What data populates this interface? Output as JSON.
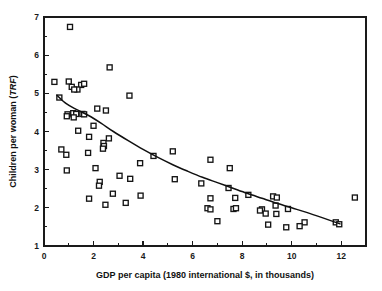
{
  "chart_data": {
    "type": "scatter",
    "title": "",
    "xlabel": "GDP per capita (1980 international $, in thousands)",
    "ylabel": "Children per woman (TRF)",
    "ylabel_plain": "Children per woman (",
    "ylabel_italic": "TRF",
    "ylabel_tail": ")",
    "xlim": [
      0,
      13
    ],
    "ylim": [
      1,
      7
    ],
    "grid": false,
    "legend": "none",
    "x_ticks": [
      0,
      2,
      4,
      6,
      8,
      10,
      12
    ],
    "x_tick_labels": [
      "0",
      "2",
      "4",
      "6",
      "8",
      "10",
      "12"
    ],
    "x_minor_ticks": [
      1,
      3,
      5,
      7,
      9,
      11,
      13
    ],
    "y_ticks": [
      1,
      2,
      3,
      4,
      5,
      6,
      7
    ],
    "y_tick_labels": [
      "1",
      "2",
      "3",
      "4",
      "5",
      "6",
      "7"
    ],
    "y_minor_ticks": [
      1.5,
      2.5,
      3.5,
      4.5,
      5.5,
      6.5
    ],
    "marker_style": "open-square",
    "series": [
      {
        "name": "countries",
        "points": [
          [
            1.05,
            6.74
          ],
          [
            2.65,
            5.68
          ],
          [
            0.42,
            5.3
          ],
          [
            1.0,
            5.31
          ],
          [
            1.5,
            5.22
          ],
          [
            1.62,
            5.25
          ],
          [
            1.12,
            5.17
          ],
          [
            1.35,
            5.1
          ],
          [
            1.22,
            5.1
          ],
          [
            3.45,
            4.94
          ],
          [
            0.62,
            4.89
          ],
          [
            2.15,
            4.6
          ],
          [
            2.5,
            4.55
          ],
          [
            0.95,
            4.45
          ],
          [
            0.92,
            4.4
          ],
          [
            1.18,
            4.48
          ],
          [
            1.3,
            4.46
          ],
          [
            1.55,
            4.46
          ],
          [
            1.2,
            4.37
          ],
          [
            1.62,
            4.45
          ],
          [
            1.38,
            4.02
          ],
          [
            2.0,
            4.15
          ],
          [
            2.62,
            3.82
          ],
          [
            1.82,
            3.86
          ],
          [
            2.4,
            3.7
          ],
          [
            2.42,
            3.62
          ],
          [
            2.38,
            3.55
          ],
          [
            0.7,
            3.53
          ],
          [
            0.9,
            3.39
          ],
          [
            1.78,
            3.44
          ],
          [
            5.2,
            3.48
          ],
          [
            4.42,
            3.36
          ],
          [
            6.72,
            3.26
          ],
          [
            3.88,
            3.17
          ],
          [
            7.5,
            3.04
          ],
          [
            2.08,
            3.04
          ],
          [
            0.92,
            2.98
          ],
          [
            3.05,
            2.84
          ],
          [
            3.48,
            2.76
          ],
          [
            5.28,
            2.75
          ],
          [
            2.25,
            2.68
          ],
          [
            6.35,
            2.64
          ],
          [
            2.22,
            2.58
          ],
          [
            7.45,
            2.52
          ],
          [
            8.25,
            2.34
          ],
          [
            3.9,
            2.32
          ],
          [
            2.78,
            2.37
          ],
          [
            9.25,
            2.3
          ],
          [
            9.4,
            2.27
          ],
          [
            12.55,
            2.27
          ],
          [
            6.72,
            2.25
          ],
          [
            7.72,
            2.26
          ],
          [
            1.82,
            2.24
          ],
          [
            3.3,
            2.13
          ],
          [
            2.48,
            2.08
          ],
          [
            9.35,
            2.06
          ],
          [
            9.85,
            1.97
          ],
          [
            7.65,
            1.97
          ],
          [
            7.75,
            1.99
          ],
          [
            6.6,
            1.99
          ],
          [
            6.72,
            1.96
          ],
          [
            8.8,
            1.96
          ],
          [
            8.72,
            1.93
          ],
          [
            9.38,
            1.84
          ],
          [
            8.95,
            1.85
          ],
          [
            11.78,
            1.62
          ],
          [
            11.92,
            1.57
          ],
          [
            10.52,
            1.62
          ],
          [
            9.05,
            1.56
          ],
          [
            10.32,
            1.52
          ],
          [
            9.78,
            1.49
          ],
          [
            7.0,
            1.65
          ]
        ]
      }
    ],
    "trend_line": {
      "name": "fitted curve",
      "points": [
        [
          0.52,
          4.95
        ],
        [
          0.9,
          4.73
        ],
        [
          1.3,
          4.58
        ],
        [
          1.8,
          4.42
        ],
        [
          2.3,
          4.22
        ],
        [
          2.8,
          4.0
        ],
        [
          3.4,
          3.76
        ],
        [
          4.0,
          3.53
        ],
        [
          4.6,
          3.32
        ],
        [
          5.2,
          3.13
        ],
        [
          5.8,
          2.96
        ],
        [
          6.4,
          2.8
        ],
        [
          7.0,
          2.66
        ],
        [
          7.6,
          2.52
        ],
        [
          8.2,
          2.38
        ],
        [
          8.8,
          2.25
        ],
        [
          9.4,
          2.12
        ],
        [
          10.0,
          2.0
        ],
        [
          10.6,
          1.88
        ],
        [
          11.2,
          1.75
        ],
        [
          11.95,
          1.58
        ]
      ]
    }
  }
}
